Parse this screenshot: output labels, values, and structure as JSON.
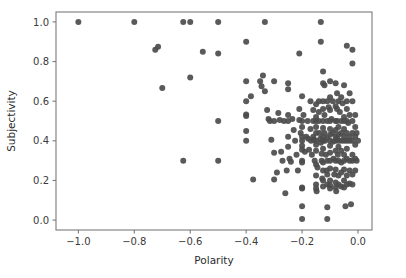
{
  "chart_data": {
    "type": "scatter",
    "title": "",
    "xlabel": "Polarity",
    "ylabel": "Subjectivity",
    "xlim": [
      -1.08,
      0.05
    ],
    "ylim": [
      -0.05,
      1.05
    ],
    "xticks": [
      -1.0,
      -0.8,
      -0.6,
      -0.4,
      -0.2,
      0.0
    ],
    "xticklabels": [
      "-1.0",
      "-0.8",
      "-0.6",
      "-0.4",
      "-0.2",
      "0.0"
    ],
    "yticks": [
      0.0,
      0.2,
      0.4,
      0.6,
      0.8,
      1.0
    ],
    "yticklabels": [
      "0.0",
      "0.2",
      "0.4",
      "0.6",
      "0.8",
      "1.0"
    ],
    "grid": false,
    "legend": null,
    "marker": {
      "color": "#4c4c4c",
      "size": 4.2,
      "shape": "circle",
      "opacity": 0.92
    },
    "n_points": 232,
    "points": [
      [
        -1.0,
        1.0
      ],
      [
        -0.8,
        1.0
      ],
      [
        -0.625,
        1.0
      ],
      [
        -0.6,
        1.0
      ],
      [
        -0.5,
        1.0
      ],
      [
        -0.333,
        1.0
      ],
      [
        -0.133,
        1.0
      ],
      [
        -0.715,
        0.875
      ],
      [
        -0.725,
        0.86
      ],
      [
        -0.7,
        0.667
      ],
      [
        -0.555,
        0.85
      ],
      [
        -0.5,
        0.84
      ],
      [
        -0.6,
        0.72
      ],
      [
        -0.5,
        0.5
      ],
      [
        -0.625,
        0.3
      ],
      [
        -0.5,
        0.3
      ],
      [
        -0.4,
        0.9
      ],
      [
        -0.4,
        0.7
      ],
      [
        -0.4,
        0.6
      ],
      [
        -0.4,
        0.533
      ],
      [
        -0.4,
        0.525
      ],
      [
        -0.4,
        0.45
      ],
      [
        -0.4,
        0.4
      ],
      [
        -0.383,
        0.625
      ],
      [
        -0.375,
        0.205
      ],
      [
        -0.35,
        0.7
      ],
      [
        -0.345,
        0.675
      ],
      [
        -0.34,
        0.73
      ],
      [
        -0.333,
        0.65
      ],
      [
        -0.325,
        0.555
      ],
      [
        -0.32,
        0.51
      ],
      [
        -0.315,
        0.5
      ],
      [
        -0.31,
        0.405
      ],
      [
        -0.3,
        0.7
      ],
      [
        -0.3,
        0.5
      ],
      [
        -0.3,
        0.34
      ],
      [
        -0.3,
        0.205
      ],
      [
        -0.29,
        0.24
      ],
      [
        -0.285,
        0.54
      ],
      [
        -0.28,
        0.505
      ],
      [
        -0.275,
        0.345
      ],
      [
        -0.27,
        0.3
      ],
      [
        -0.265,
        0.5
      ],
      [
        -0.26,
        0.135
      ],
      [
        -0.255,
        0.25
      ],
      [
        -0.25,
        0.69
      ],
      [
        -0.25,
        0.66
      ],
      [
        -0.25,
        0.53
      ],
      [
        -0.25,
        0.5
      ],
      [
        -0.25,
        0.42
      ],
      [
        -0.25,
        0.37
      ],
      [
        -0.245,
        0.31
      ],
      [
        -0.24,
        0.295
      ],
      [
        -0.235,
        0.51
      ],
      [
        -0.23,
        0.455
      ],
      [
        -0.225,
        0.4
      ],
      [
        -0.22,
        0.33
      ],
      [
        -0.215,
        0.25
      ],
      [
        -0.21,
        0.84
      ],
      [
        -0.21,
        0.56
      ],
      [
        -0.21,
        0.505
      ],
      [
        -0.205,
        0.44
      ],
      [
        -0.2,
        0.625
      ],
      [
        -0.2,
        0.5
      ],
      [
        -0.2,
        0.47
      ],
      [
        -0.2,
        0.42
      ],
      [
        -0.2,
        0.4
      ],
      [
        -0.2,
        0.375
      ],
      [
        -0.2,
        0.355
      ],
      [
        -0.2,
        0.3
      ],
      [
        -0.2,
        0.29
      ],
      [
        -0.2,
        0.165
      ],
      [
        -0.2,
        0.16
      ],
      [
        -0.2,
        0.07
      ],
      [
        -0.2,
        0.005
      ],
      [
        -0.195,
        0.53
      ],
      [
        -0.19,
        0.345
      ],
      [
        -0.185,
        0.42
      ],
      [
        -0.18,
        0.5
      ],
      [
        -0.178,
        0.41
      ],
      [
        -0.175,
        0.355
      ],
      [
        -0.17,
        0.6
      ],
      [
        -0.17,
        0.46
      ],
      [
        -0.168,
        0.4
      ],
      [
        -0.165,
        0.33
      ],
      [
        -0.16,
        0.555
      ],
      [
        -0.16,
        0.5
      ],
      [
        -0.16,
        0.42
      ],
      [
        -0.158,
        0.405
      ],
      [
        -0.155,
        0.3
      ],
      [
        -0.15,
        0.585
      ],
      [
        -0.15,
        0.52
      ],
      [
        -0.15,
        0.5
      ],
      [
        -0.15,
        0.47
      ],
      [
        -0.15,
        0.44
      ],
      [
        -0.15,
        0.4
      ],
      [
        -0.15,
        0.38
      ],
      [
        -0.15,
        0.35
      ],
      [
        -0.15,
        0.28
      ],
      [
        -0.15,
        0.225
      ],
      [
        -0.15,
        0.18
      ],
      [
        -0.15,
        0.16
      ],
      [
        -0.148,
        0.145
      ],
      [
        -0.145,
        0.265
      ],
      [
        -0.14,
        0.6
      ],
      [
        -0.14,
        0.545
      ],
      [
        -0.14,
        0.5
      ],
      [
        -0.138,
        0.44
      ],
      [
        -0.135,
        0.41
      ],
      [
        -0.133,
        0.9
      ],
      [
        -0.133,
        0.39
      ],
      [
        -0.13,
        0.335
      ],
      [
        -0.13,
        0.3
      ],
      [
        -0.128,
        0.21
      ],
      [
        -0.125,
        0.75
      ],
      [
        -0.125,
        0.69
      ],
      [
        -0.125,
        0.6
      ],
      [
        -0.125,
        0.56
      ],
      [
        -0.125,
        0.5
      ],
      [
        -0.125,
        0.465
      ],
      [
        -0.125,
        0.42
      ],
      [
        -0.125,
        0.4
      ],
      [
        -0.125,
        0.36
      ],
      [
        -0.125,
        0.29
      ],
      [
        -0.125,
        0.25
      ],
      [
        -0.125,
        0.2
      ],
      [
        -0.125,
        0.17
      ],
      [
        -0.12,
        0.68
      ],
      [
        -0.12,
        0.53
      ],
      [
        -0.12,
        0.44
      ],
      [
        -0.118,
        0.4
      ],
      [
        -0.115,
        0.33
      ],
      [
        -0.112,
        0.25
      ],
      [
        -0.11,
        0.6
      ],
      [
        -0.11,
        0.5
      ],
      [
        -0.11,
        0.415
      ],
      [
        -0.11,
        0.3
      ],
      [
        -0.11,
        0.23
      ],
      [
        -0.11,
        0.18
      ],
      [
        -0.11,
        0.065
      ],
      [
        -0.11,
        0.005
      ],
      [
        -0.105,
        0.57
      ],
      [
        -0.1,
        0.7
      ],
      [
        -0.1,
        0.62
      ],
      [
        -0.1,
        0.555
      ],
      [
        -0.1,
        0.5
      ],
      [
        -0.1,
        0.46
      ],
      [
        -0.1,
        0.43
      ],
      [
        -0.1,
        0.4
      ],
      [
        -0.1,
        0.375
      ],
      [
        -0.1,
        0.34
      ],
      [
        -0.1,
        0.3
      ],
      [
        -0.1,
        0.26
      ],
      [
        -0.1,
        0.2
      ],
      [
        -0.1,
        0.175
      ],
      [
        -0.1,
        0.16
      ],
      [
        -0.095,
        0.51
      ],
      [
        -0.09,
        0.6
      ],
      [
        -0.09,
        0.44
      ],
      [
        -0.09,
        0.395
      ],
      [
        -0.088,
        0.31
      ],
      [
        -0.085,
        0.23
      ],
      [
        -0.08,
        0.69
      ],
      [
        -0.08,
        0.575
      ],
      [
        -0.08,
        0.5
      ],
      [
        -0.08,
        0.455
      ],
      [
        -0.08,
        0.42
      ],
      [
        -0.08,
        0.4
      ],
      [
        -0.08,
        0.35
      ],
      [
        -0.08,
        0.3
      ],
      [
        -0.08,
        0.255
      ],
      [
        -0.08,
        0.19
      ],
      [
        -0.08,
        0.165
      ],
      [
        -0.078,
        0.145
      ],
      [
        -0.075,
        0.64
      ],
      [
        -0.075,
        0.56
      ],
      [
        -0.075,
        0.5
      ],
      [
        -0.075,
        0.41
      ],
      [
        -0.072,
        0.33
      ],
      [
        -0.07,
        0.6
      ],
      [
        -0.07,
        0.47
      ],
      [
        -0.07,
        0.43
      ],
      [
        -0.07,
        0.4
      ],
      [
        -0.07,
        0.37
      ],
      [
        -0.07,
        0.3
      ],
      [
        -0.07,
        0.225
      ],
      [
        -0.07,
        0.18
      ],
      [
        -0.065,
        0.545
      ],
      [
        -0.06,
        0.62
      ],
      [
        -0.06,
        0.5
      ],
      [
        -0.06,
        0.44
      ],
      [
        -0.06,
        0.4
      ],
      [
        -0.06,
        0.35
      ],
      [
        -0.06,
        0.29
      ],
      [
        -0.06,
        0.24
      ],
      [
        -0.06,
        0.17
      ],
      [
        -0.055,
        0.59
      ],
      [
        -0.05,
        0.68
      ],
      [
        -0.05,
        0.52
      ],
      [
        -0.05,
        0.5
      ],
      [
        -0.05,
        0.46
      ],
      [
        -0.05,
        0.42
      ],
      [
        -0.05,
        0.4
      ],
      [
        -0.05,
        0.33
      ],
      [
        -0.05,
        0.3
      ],
      [
        -0.05,
        0.255
      ],
      [
        -0.05,
        0.2
      ],
      [
        -0.05,
        0.165
      ],
      [
        -0.045,
        0.07
      ],
      [
        -0.04,
        0.88
      ],
      [
        -0.04,
        0.6
      ],
      [
        -0.04,
        0.56
      ],
      [
        -0.04,
        0.5
      ],
      [
        -0.04,
        0.44
      ],
      [
        -0.04,
        0.4
      ],
      [
        -0.04,
        0.36
      ],
      [
        -0.04,
        0.31
      ],
      [
        -0.04,
        0.225
      ],
      [
        -0.04,
        0.18
      ],
      [
        -0.035,
        0.49
      ],
      [
        -0.03,
        0.64
      ],
      [
        -0.03,
        0.53
      ],
      [
        -0.03,
        0.42
      ],
      [
        -0.03,
        0.4
      ],
      [
        -0.03,
        0.3
      ],
      [
        -0.03,
        0.25
      ],
      [
        -0.03,
        0.185
      ],
      [
        -0.025,
        0.08
      ],
      [
        -0.02,
        0.86
      ],
      [
        -0.02,
        0.79
      ],
      [
        -0.02,
        0.6
      ],
      [
        -0.02,
        0.5
      ],
      [
        -0.02,
        0.44
      ],
      [
        -0.02,
        0.4
      ],
      [
        -0.02,
        0.33
      ],
      [
        -0.02,
        0.3
      ],
      [
        -0.02,
        0.23
      ],
      [
        -0.02,
        0.18
      ],
      [
        -0.01,
        0.53
      ],
      [
        -0.01,
        0.47
      ],
      [
        -0.01,
        0.42
      ],
      [
        -0.01,
        0.38
      ],
      [
        -0.01,
        0.31
      ],
      [
        -0.01,
        0.25
      ],
      [
        -0.005,
        0.44
      ],
      [
        -0.005,
        0.3
      ],
      [
        0.0,
        0.4
      ]
    ]
  }
}
